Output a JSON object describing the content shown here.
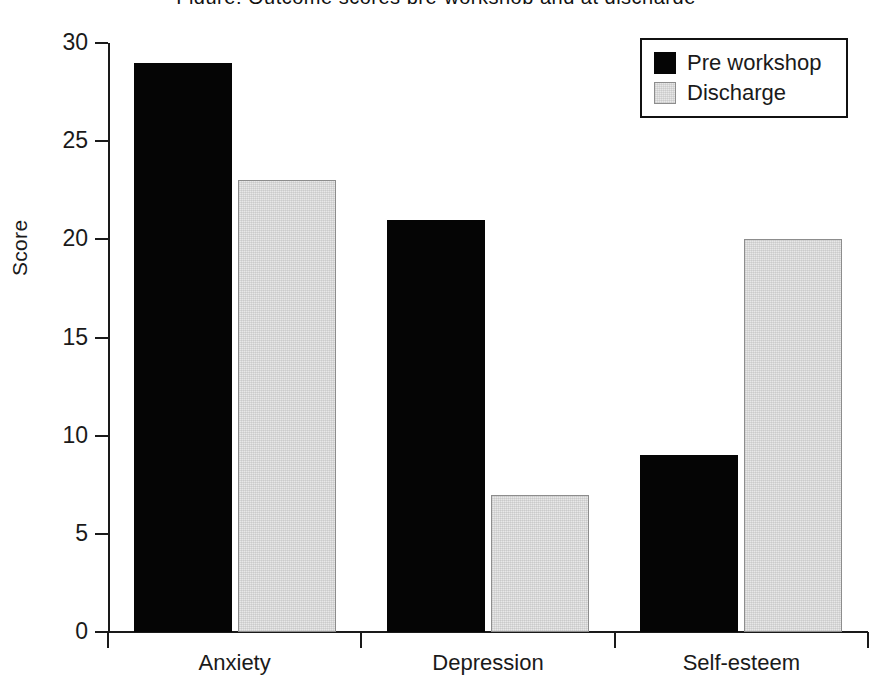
{
  "figure": {
    "partial_title_top_cut": "Figure: Outcome scores pre-workshop and at discharge"
  },
  "chart_data": {
    "type": "bar",
    "title": "",
    "xlabel": "",
    "ylabel": "Score",
    "categories": [
      "Anxiety",
      "Depression",
      "Self-esteem"
    ],
    "series": [
      {
        "name": "Pre workshop",
        "color": "#050505",
        "values": [
          29,
          21,
          9
        ]
      },
      {
        "name": "Discharge",
        "color": "#e8e8e8",
        "values": [
          23,
          7,
          20
        ]
      }
    ],
    "ylim": [
      0,
      30
    ],
    "ytick_values": [
      0,
      5,
      10,
      15,
      20,
      25,
      30
    ],
    "ytick_labels": [
      "0",
      "5",
      "10",
      "15",
      "20",
      "25",
      "30"
    ],
    "grid": false,
    "legend_position": "top-right",
    "legend_entries": [
      "Pre workshop",
      "Discharge"
    ]
  },
  "axes": {
    "y_title": "Score",
    "ticks": [
      {
        "label": "30",
        "value": 30
      },
      {
        "label": "25",
        "value": 25
      },
      {
        "label": "20",
        "value": 20
      },
      {
        "label": "15",
        "value": 15
      },
      {
        "label": "10",
        "value": 10
      },
      {
        "label": "5",
        "value": 5
      },
      {
        "label": "0",
        "value": 0
      }
    ]
  },
  "legend": {
    "items": [
      {
        "label": "Pre workshop",
        "swatch": "black-square-icon"
      },
      {
        "label": "Discharge",
        "swatch": "light-gray-square-icon"
      }
    ]
  }
}
